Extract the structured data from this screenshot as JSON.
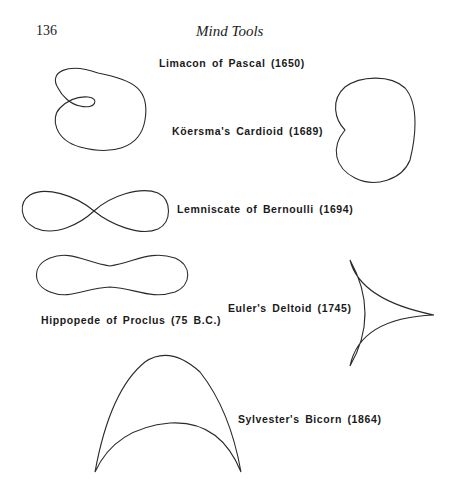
{
  "page": {
    "number": "136",
    "running_head": "Mind Tools"
  },
  "figure": {
    "curves": [
      {
        "id": "limacon",
        "label": "Limacon of Pascal (1650)"
      },
      {
        "id": "cardioid",
        "label": "Köersma's Cardioid (1689)"
      },
      {
        "id": "lemniscate",
        "label": "Lemniscate of Bernoulli (1694)"
      },
      {
        "id": "hippopede",
        "label": "Hippopede of Proclus (75 B.C.)"
      },
      {
        "id": "deltoid",
        "label": "Euler's Deltoid   (1745)"
      },
      {
        "id": "bicorn",
        "label": "Sylvester's Bicorn (1864)"
      }
    ]
  }
}
